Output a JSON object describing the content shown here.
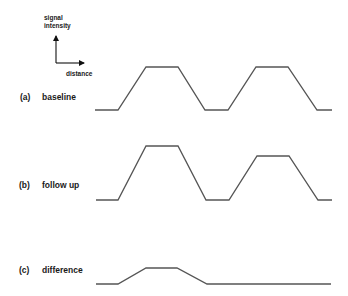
{
  "axes_legend": {
    "y_label_line1": "signal",
    "y_label_line2": "intensity",
    "x_label": "distance"
  },
  "rows": [
    {
      "id": "a",
      "tag": "(a)",
      "label": "baseline",
      "points": "95,110 118,110 146,67 178,67 205,110 228,110 256,67 288,67 317,110 332,110"
    },
    {
      "id": "b",
      "tag": "(b)",
      "label": "follow up",
      "points": "96,200 118,200 146,146 178,146 206,200 229,200 257,156 289,156 318,200 332,200"
    },
    {
      "id": "c",
      "tag": "(c)",
      "label": "difference",
      "points": "96,284 118,284 146,268 177,268 207,284 331,284"
    }
  ],
  "colors": {
    "wave": "#555555",
    "text": "#1a1a1a",
    "background": "#ffffff"
  }
}
